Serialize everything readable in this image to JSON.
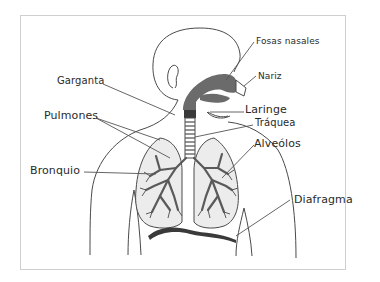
{
  "diagram": {
    "colors": {
      "outline": "#4a4a4a",
      "airway": "#6b6b6b",
      "lung_fill": "#ececec",
      "bronchi": "#5a5a5a",
      "frame": "#cfcfcf"
    },
    "labels": {
      "fosas_nasales": "Fosas nasales",
      "nariz": "Nariz",
      "garganta": "Garganta",
      "laringe": "Laringe",
      "pulmones": "Pulmones",
      "traquea": "Tráquea",
      "alveolos": "Alveólos",
      "bronquio": "Bronquio",
      "diafragma": "Diafragma"
    }
  }
}
